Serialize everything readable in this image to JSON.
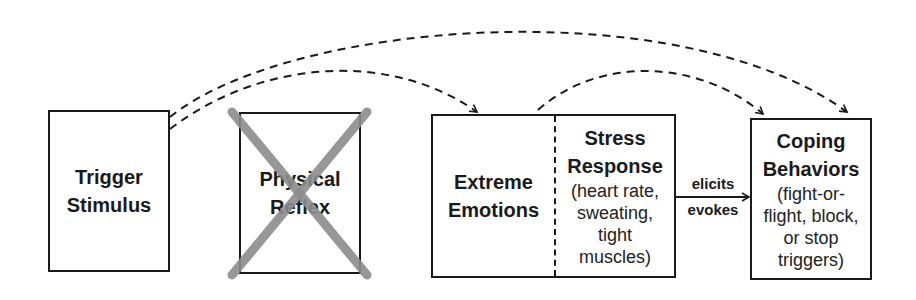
{
  "nodes": {
    "trigger": {
      "title_line1": "Trigger",
      "title_line2": "Stimulus"
    },
    "reflex": {
      "title_line1": "Physical",
      "title_line2": "Reflex",
      "crossed_out": true
    },
    "emotions": {
      "title_line1": "Extreme",
      "title_line2": "Emotions"
    },
    "stress": {
      "title_line1": "Stress",
      "title_line2": "Response",
      "detail_lines": [
        "(heart rate,",
        "sweating,",
        "tight",
        "muscles)"
      ]
    },
    "coping": {
      "title_line1": "Coping",
      "title_line2": "Behaviors",
      "detail_lines": [
        "(fight-or-",
        "flight, block,",
        "or stop",
        "triggers)"
      ]
    }
  },
  "edges": {
    "elicits": {
      "label_top": "elicits",
      "label_bottom": "evokes",
      "from": "stress",
      "to": "coping",
      "style": "solid"
    },
    "trigger_to_emotions": {
      "from": "trigger",
      "to": "emotions",
      "style": "dashed"
    },
    "trigger_to_coping": {
      "from": "trigger",
      "to": "coping",
      "style": "dashed"
    },
    "emotions_to_coping": {
      "from": "emotions",
      "to": "coping",
      "style": "dashed"
    }
  },
  "colors": {
    "line": "#1a1a1a",
    "cross": "#8c8c8c"
  }
}
